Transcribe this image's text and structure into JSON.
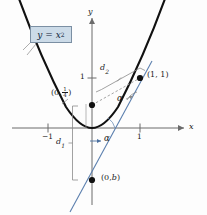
{
  "figure": {
    "kind": "coordinate-plane-diagram",
    "axes": {
      "x_axis_label": "x",
      "y_axis_label": "y",
      "x_ticks": [
        {
          "value": "-1",
          "label": "−1",
          "px": 48
        },
        {
          "value": "1",
          "label": "1",
          "px": 140
        }
      ],
      "y_ticks": [
        {
          "value": "1",
          "label": "1",
          "px": 78
        }
      ],
      "origin_px": {
        "x": 92,
        "y": 128
      },
      "unit_px": 48
    },
    "curve_label": {
      "text": "y = x",
      "exponent": "2",
      "full": "y = x²",
      "box_fill": "#ccdbe8",
      "box_stroke": "#7b8fa3"
    },
    "points": [
      {
        "id": "focus",
        "label_open": "(0,",
        "label_num": "1",
        "label_den": "4",
        "label_close": ")",
        "full": "(0, 1/4)",
        "px": {
          "x": 92,
          "y": 105
        }
      },
      {
        "id": "curve-point",
        "label": "(1, 1)",
        "px": {
          "x": 140,
          "y": 78
        }
      },
      {
        "id": "directrix-intercept",
        "label_prefix": "(0,",
        "label_var": "b",
        "label_close": ")",
        "full": "(0, b)",
        "px": {
          "x": 92,
          "y": 180
        }
      }
    ],
    "distances": [
      {
        "id": "d2",
        "base": "d",
        "sub": "2",
        "full": "d₂"
      },
      {
        "id": "d1",
        "base": "d",
        "sub": "1",
        "full": "d₁"
      }
    ],
    "angles": [
      {
        "id": "alpha-upper",
        "label": "α"
      },
      {
        "id": "alpha-lower",
        "label": "α"
      }
    ],
    "colors": {
      "curve": "#111111",
      "axis": "#6b6b6b",
      "tangent_line": "#5b7fae",
      "bracket": "#8a8a8a",
      "dashed": "#9a9a9a",
      "box_fill": "#ccdbe8",
      "box_stroke": "#7b8fa3",
      "text": "#1a1a1a"
    }
  }
}
